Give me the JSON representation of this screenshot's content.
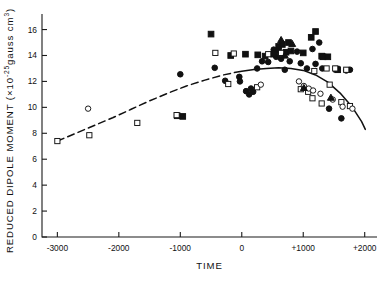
{
  "chart_data": {
    "type": "scatter",
    "title": "",
    "xlabel": "TIME",
    "ylabel": "REDUCED DIPOLE MOMENT (×10⁻²⁵gauss cm³)",
    "ylabel_parts": {
      "main": "REDUCED DIPOLE MOMENT (×10",
      "exponent": "-25",
      "unit": "gauss cm",
      "unit_exponent": "3",
      "close": ")"
    },
    "xlim": [
      -3250,
      2200
    ],
    "ylim": [
      0,
      17.2
    ],
    "xticks": [
      -3000,
      -2000,
      -1000,
      0,
      1000,
      2000
    ],
    "xticklabels": [
      "-3000",
      "-2000",
      "-1000",
      "0",
      "+1000",
      "+2000"
    ],
    "yticks": [
      0,
      2,
      4,
      6,
      8,
      10,
      12,
      14,
      16
    ],
    "yticklabels": [
      "0",
      "2",
      "4",
      "6",
      "8",
      "10",
      "12",
      "14",
      "16"
    ],
    "grid": false,
    "legend": "none",
    "series": [
      {
        "name": "filled-circle",
        "marker": "filled-circle",
        "points": [
          [
            -1000,
            12.55
          ],
          [
            -440,
            13.05
          ],
          [
            -270,
            12.05
          ],
          [
            -40,
            12.35
          ],
          [
            -30,
            12.0
          ],
          [
            70,
            11.25
          ],
          [
            120,
            11.0
          ],
          [
            150,
            11.45
          ],
          [
            185,
            11.2
          ],
          [
            250,
            13.0
          ],
          [
            330,
            13.55
          ],
          [
            430,
            13.5
          ],
          [
            520,
            14.45
          ],
          [
            560,
            13.9
          ],
          [
            600,
            14.35
          ],
          [
            640,
            13.75
          ],
          [
            700,
            12.9
          ],
          [
            780,
            13.55
          ],
          [
            900,
            14.3
          ],
          [
            960,
            13.4
          ],
          [
            1060,
            13.0
          ],
          [
            1150,
            14.5
          ],
          [
            1200,
            13.35
          ],
          [
            1260,
            15.0
          ],
          [
            1310,
            13.0
          ],
          [
            1420,
            9.9
          ],
          [
            1620,
            9.15
          ],
          [
            1700,
            12.85
          ],
          [
            1760,
            12.9
          ]
        ]
      },
      {
        "name": "filled-square",
        "marker": "filled-square",
        "points": [
          [
            -1050,
            9.35
          ],
          [
            -960,
            9.3
          ],
          [
            -500,
            15.65
          ],
          [
            -180,
            14.0
          ],
          [
            60,
            14.1
          ],
          [
            260,
            14.05
          ],
          [
            380,
            13.95
          ],
          [
            520,
            14.1
          ],
          [
            600,
            14.7
          ],
          [
            660,
            14.85
          ],
          [
            720,
            14.25
          ],
          [
            760,
            15.0
          ],
          [
            800,
            14.35
          ],
          [
            1000,
            14.2
          ],
          [
            1130,
            15.4
          ],
          [
            1200,
            15.85
          ],
          [
            1300,
            13.95
          ],
          [
            1320,
            13.9
          ],
          [
            1400,
            13.9
          ],
          [
            1540,
            12.95
          ],
          [
            1560,
            12.9
          ]
        ]
      },
      {
        "name": "open-square",
        "marker": "open-square",
        "points": [
          [
            -3000,
            7.4
          ],
          [
            -2480,
            7.85
          ],
          [
            -1700,
            8.8
          ],
          [
            -1060,
            9.4
          ],
          [
            -430,
            14.2
          ],
          [
            -220,
            11.8
          ],
          [
            -130,
            14.15
          ],
          [
            250,
            11.55
          ],
          [
            430,
            14.1
          ],
          [
            640,
            14.2
          ],
          [
            960,
            11.4
          ],
          [
            1080,
            11.2
          ],
          [
            1150,
            10.7
          ],
          [
            1180,
            12.8
          ],
          [
            1300,
            10.3
          ],
          [
            1380,
            13.0
          ],
          [
            1430,
            11.75
          ],
          [
            1520,
            13.0
          ],
          [
            1620,
            10.4
          ],
          [
            1700,
            12.9
          ],
          [
            1760,
            10.1
          ]
        ]
      },
      {
        "name": "open-circle",
        "marker": "open-circle",
        "points": [
          [
            -2500,
            9.9
          ],
          [
            310,
            11.75
          ],
          [
            930,
            12.0
          ],
          [
            1010,
            11.65
          ],
          [
            1090,
            11.45
          ],
          [
            1160,
            11.3
          ],
          [
            1280,
            11.05
          ],
          [
            1480,
            10.6
          ],
          [
            1640,
            10.05
          ],
          [
            1800,
            9.9
          ]
        ]
      },
      {
        "name": "filled-triangle",
        "marker": "filled-triangle",
        "points": [
          [
            640,
            15.2
          ],
          [
            700,
            14.0
          ],
          [
            820,
            14.9
          ],
          [
            1010,
            11.5
          ],
          [
            1450,
            10.75
          ]
        ]
      }
    ],
    "trend_curve": {
      "label": "fitted trend",
      "dashed_segment_range": [
        -3000,
        -120
      ],
      "solid_segment_range": [
        -120,
        2010
      ],
      "points": [
        [
          -3000,
          7.4
        ],
        [
          -2700,
          8.0
        ],
        [
          -2400,
          8.6
        ],
        [
          -2100,
          9.2
        ],
        [
          -1800,
          9.85
        ],
        [
          -1500,
          10.5
        ],
        [
          -1200,
          11.1
        ],
        [
          -900,
          11.65
        ],
        [
          -600,
          12.1
        ],
        [
          -300,
          12.5
        ],
        [
          -120,
          12.68
        ],
        [
          0,
          12.78
        ],
        [
          200,
          12.92
        ],
        [
          400,
          13.0
        ],
        [
          600,
          13.05
        ],
        [
          800,
          13.0
        ],
        [
          1000,
          12.85
        ],
        [
          1200,
          12.5
        ],
        [
          1400,
          11.95
        ],
        [
          1600,
          11.1
        ],
        [
          1800,
          10.0
        ],
        [
          1950,
          8.9
        ],
        [
          2010,
          8.3
        ]
      ]
    }
  }
}
